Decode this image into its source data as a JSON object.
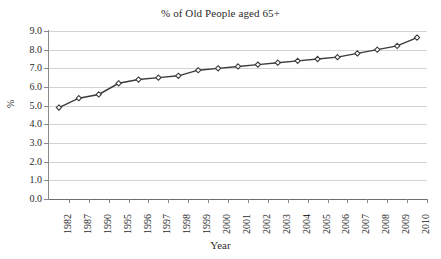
{
  "chart_data": {
    "type": "line",
    "title": "% of Old People aged 65+",
    "xlabel": "Year",
    "ylabel": "%",
    "categories": [
      "1982",
      "1987",
      "1990",
      "1995",
      "1996",
      "1997",
      "1998",
      "1999",
      "2000",
      "2001",
      "2002",
      "2003",
      "2004",
      "2005",
      "2006",
      "2007",
      "2008",
      "2009",
      "2010"
    ],
    "values": [
      4.9,
      5.4,
      5.6,
      6.2,
      6.4,
      6.5,
      6.6,
      6.9,
      7.0,
      7.1,
      7.2,
      7.3,
      7.4,
      7.5,
      7.6,
      7.8,
      8.0,
      8.2,
      8.65
    ],
    "series": [
      {
        "name": "% of Old People aged 65+",
        "values": [
          4.9,
          5.4,
          5.6,
          6.2,
          6.4,
          6.5,
          6.6,
          6.9,
          7.0,
          7.1,
          7.2,
          7.3,
          7.4,
          7.5,
          7.6,
          7.8,
          8.0,
          8.2,
          8.65
        ]
      }
    ],
    "ylim": [
      0.0,
      9.0
    ],
    "yticks": [
      "0.0",
      "1.0",
      "2.0",
      "3.0",
      "4.0",
      "5.0",
      "6.0",
      "7.0",
      "8.0",
      "9.0"
    ],
    "ytick_values": [
      0.0,
      1.0,
      2.0,
      3.0,
      4.0,
      5.0,
      6.0,
      7.0,
      8.0,
      9.0
    ],
    "grid": true,
    "legend": "none",
    "marker": "diamond",
    "line_color": "#3b3b3b",
    "grid_color": "#d3d3d3",
    "marker_fill": "#ffffff",
    "background": "#ffffff"
  }
}
